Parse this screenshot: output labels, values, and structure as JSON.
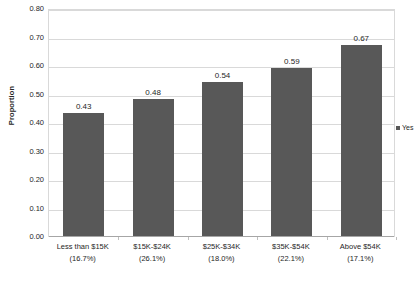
{
  "chart_data": {
    "type": "bar",
    "title": "",
    "xlabel": "",
    "ylabel": "Proportion",
    "ylim": [
      0.0,
      0.8
    ],
    "ytick_step": 0.1,
    "grid": true,
    "legend_position": "right",
    "categories": [
      "Less than $15K",
      "$15K-$24K",
      "$25K-$34K",
      "$35K-$54K",
      "Above $54K"
    ],
    "category_sublabels": [
      "(16.7%)",
      "(26.1%)",
      "(18.0%)",
      "(22.1%)",
      "(17.1%)"
    ],
    "values": [
      0.43,
      0.48,
      0.54,
      0.59,
      0.67
    ],
    "value_labels": [
      "0.43",
      "0.48",
      "0.54",
      "0.59",
      "0.67"
    ],
    "series": [
      {
        "name": "Yes",
        "color": "#585858",
        "values": [
          0.43,
          0.48,
          0.54,
          0.59,
          0.67
        ]
      }
    ],
    "ytick_labels": [
      "0.80",
      "0.70",
      "0.60",
      "0.50",
      "0.40",
      "0.30",
      "0.20",
      "0.10",
      "0.00"
    ],
    "ytick_values": [
      0.8,
      0.7,
      0.6,
      0.5,
      0.4,
      0.3,
      0.2,
      0.1,
      0.0
    ]
  },
  "legend": {
    "entries": [
      {
        "label": "Yes",
        "color": "#585858"
      }
    ]
  },
  "axis": {
    "y_title": "Proportion"
  },
  "colors": {
    "bar": "#585858",
    "gridline": "#d9d9d9",
    "text": "#262626",
    "background": "#ffffff"
  }
}
